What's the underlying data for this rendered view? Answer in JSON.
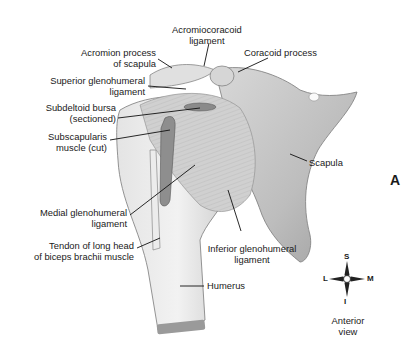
{
  "figure": {
    "panel_label": "A",
    "view_label_line1": "Anterior",
    "view_label_line2": "view",
    "compass": {
      "superior": "S",
      "inferior": "I",
      "lateral": "L",
      "medial": "M"
    },
    "labels": [
      {
        "id": "acromiocoracoid",
        "line1": "Acromiocoracoid",
        "line2": "ligament"
      },
      {
        "id": "coracoid",
        "line1": "Coracoid process"
      },
      {
        "id": "acromion",
        "line1": "Acromion process",
        "line2": "of scapula"
      },
      {
        "id": "sup-gh",
        "line1": "Superior glenohumeral",
        "line2": "ligament"
      },
      {
        "id": "subdeltoid",
        "line1": "Subdeltoid bursa",
        "line2": "(sectioned)"
      },
      {
        "id": "subscap",
        "line1": "Subscapularis",
        "line2": "muscle (cut)"
      },
      {
        "id": "scapula",
        "line1": "Scapula"
      },
      {
        "id": "med-gh",
        "line1": "Medial glenohumeral",
        "line2": "ligament"
      },
      {
        "id": "tendon",
        "line1": "Tendon of long head",
        "line2": "of biceps brachii muscle"
      },
      {
        "id": "inf-gh",
        "line1": "Inferior glenohumeral",
        "line2": "ligament"
      },
      {
        "id": "humerus",
        "line1": "Humerus"
      }
    ]
  }
}
